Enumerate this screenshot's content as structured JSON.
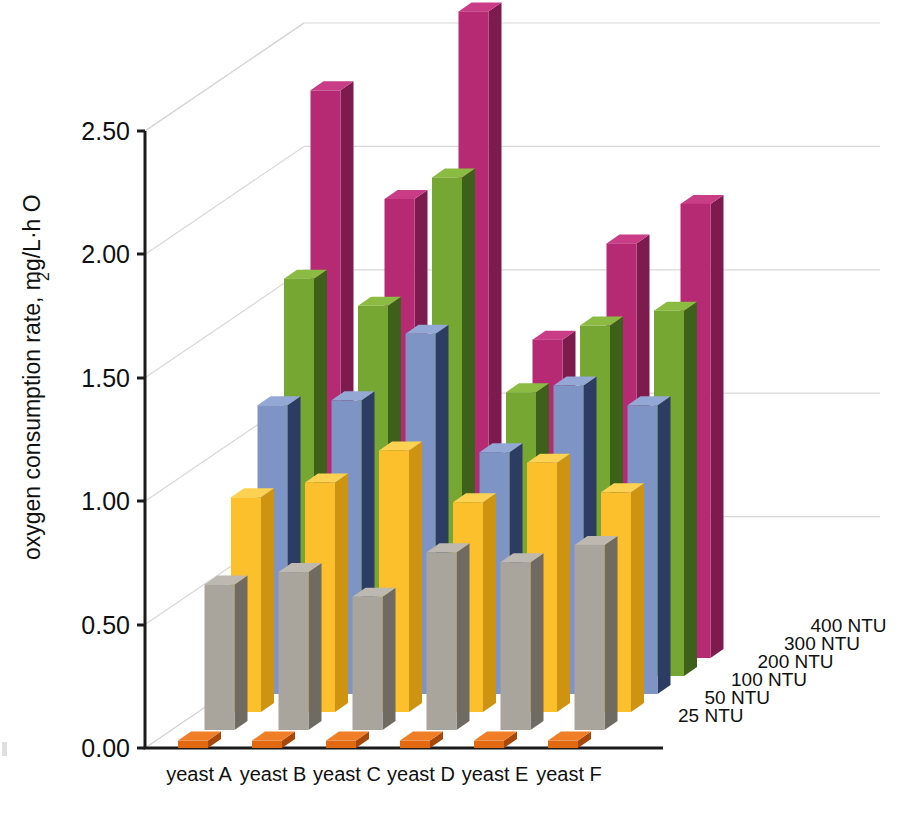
{
  "chart_data": {
    "type": "bar",
    "subtype": "3d-grouped-bar",
    "title": "",
    "xlabel": "",
    "ylabel": "oxygen consumption rate, mg/L·h O₂",
    "ylabel_main": "oxygen consumption rate, mg/L·h O",
    "ylabel_subscript": "2",
    "zlabel": "",
    "categories": [
      "yeast A",
      "yeast B",
      "yeast C",
      "yeast D",
      "yeast E",
      "yeast F"
    ],
    "ylim": [
      0.0,
      2.75
    ],
    "yticks": [
      0.0,
      0.5,
      1.0,
      1.5,
      2.0,
      2.5
    ],
    "ytick_labels": [
      "0.00",
      "0.50",
      "1.00",
      "1.50",
      "2.00",
      "2.50"
    ],
    "grid": true,
    "grid_axis": "y",
    "legend_position": "right-depth-axis",
    "series": [
      {
        "name": "25 NTU",
        "color": "#e2690f",
        "side_color": "#a8470a",
        "top_color": "#f07e26",
        "values": [
          0.03,
          0.03,
          0.03,
          0.03,
          0.03,
          0.03
        ]
      },
      {
        "name": "50 NTU",
        "color": "#a9a49c",
        "side_color": "#6f6a62",
        "top_color": "#bdb8b0",
        "values": [
          0.59,
          0.64,
          0.54,
          0.72,
          0.68,
          0.75
        ]
      },
      {
        "name": "100 NTU",
        "color": "#fbc02c",
        "side_color": "#cf9312",
        "top_color": "#fdd152",
        "values": [
          0.87,
          0.93,
          1.06,
          0.85,
          1.01,
          0.89
        ]
      },
      {
        "name": "200 NTU",
        "color": "#7d94c4",
        "side_color": "#2d3c63",
        "top_color": "#93a8d4",
        "values": [
          1.17,
          1.19,
          1.46,
          0.98,
          1.25,
          1.17
        ]
      },
      {
        "name": "300 NTU",
        "color": "#76a732",
        "side_color": "#3d601a",
        "top_color": "#8bbb43",
        "values": [
          1.61,
          1.5,
          2.02,
          1.15,
          1.42,
          1.48
        ]
      },
      {
        "name": "400 NTU",
        "color": "#b52a73",
        "side_color": "#7d1a4e",
        "top_color": "#c93d86",
        "values": [
          2.3,
          1.86,
          2.62,
          1.29,
          1.68,
          1.84
        ]
      }
    ]
  },
  "axes": {
    "y_tick_labels": [
      "2.50",
      "2.00",
      "1.50",
      "1.00",
      "0.50",
      "0.00"
    ],
    "x_category_labels": [
      "yeast A",
      "yeast B",
      "yeast C",
      "yeast D",
      "yeast E",
      "yeast F"
    ],
    "depth_labels": [
      "400 NTU",
      "300 NTU",
      "200 NTU",
      "100 NTU",
      "50 NTU",
      "25 NTU"
    ]
  },
  "colors": {
    "background": "#ffffff",
    "axis": "#1a1a1a",
    "gridline": "#d8d8d8",
    "text": "#111111",
    "series_25": "#e2690f",
    "series_50": "#a9a49c",
    "series_100": "#fbc02c",
    "series_200": "#7d94c4",
    "series_300": "#76a732",
    "series_400": "#b52a73"
  }
}
